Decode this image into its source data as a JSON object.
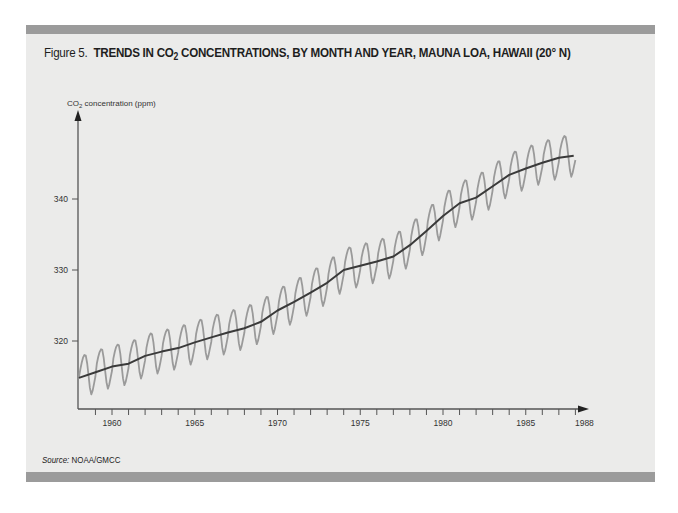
{
  "figure": {
    "prefix": "Figure 5.",
    "title_part1": "TRENDS IN CO",
    "title_sub": "2",
    "title_part2": " CONCENTRATIONS, BY MONTH AND YEAR, MAUNA LOA, HAWAII (20° N)",
    "source_label": "Source:",
    "source_value": " NOAA/GMCC"
  },
  "colors": {
    "band": "#9b9b9b",
    "panel": "#ebebea",
    "trend_line": "#3a3a3a",
    "seasonal_line": "#9a9a9a",
    "axis": "#555555"
  },
  "chart_data": {
    "type": "line",
    "xlabel": "",
    "ylabel": "CO2 concentration (ppm)",
    "xlim": [
      1958.0,
      1988.0
    ],
    "ylim": [
      310.0,
      356.0
    ],
    "x_ticks_major": [
      1960,
      1965,
      1970,
      1975,
      1980,
      1985,
      1988
    ],
    "x_tick_labels": [
      "1960",
      "1965",
      "1970",
      "1975",
      "1980",
      "1985",
      "1988"
    ],
    "x_ticks_minor": [
      1959,
      1960,
      1961,
      1962,
      1963,
      1964,
      1965,
      1966,
      1967,
      1968,
      1969,
      1970,
      1971,
      1972,
      1973,
      1974,
      1975,
      1976,
      1977,
      1978,
      1979,
      1980,
      1981,
      1982,
      1983,
      1984,
      1985,
      1986,
      1987,
      1988
    ],
    "y_ticks": [
      320,
      330,
      340
    ],
    "y_tick_labels": [
      "320",
      "330",
      "340"
    ],
    "grid": false,
    "legend": null,
    "series": [
      {
        "name": "Annual trend (smoothed)",
        "style": "dark",
        "x": [
          1958.0,
          1959.0,
          1960.0,
          1961.0,
          1962.0,
          1963.0,
          1964.0,
          1965.0,
          1966.0,
          1967.0,
          1968.0,
          1969.0,
          1970.0,
          1971.0,
          1972.0,
          1973.0,
          1974.0,
          1975.0,
          1976.0,
          1977.0,
          1978.0,
          1979.0,
          1980.0,
          1981.0,
          1982.0,
          1983.0,
          1984.0,
          1985.0,
          1986.0,
          1987.0,
          1987.9
        ],
        "values": [
          314.8,
          315.6,
          316.4,
          316.8,
          317.9,
          318.5,
          319.0,
          319.8,
          320.5,
          321.2,
          321.8,
          322.7,
          324.3,
          325.5,
          326.8,
          328.2,
          330.0,
          330.6,
          331.2,
          331.9,
          333.5,
          335.5,
          337.6,
          339.4,
          340.2,
          341.8,
          343.4,
          344.3,
          345.1,
          345.8,
          346.1
        ]
      },
      {
        "name": "Monthly values",
        "style": "light",
        "seasonal_amplitude_ppm": 3.0,
        "note": "Monthly series oscillates ~±3 ppm around the trend, peaking in late spring and bottoming in early autumn each year."
      }
    ]
  }
}
